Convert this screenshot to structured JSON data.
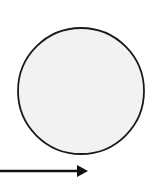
{
  "diagram": {
    "background": "#ffffff",
    "circle": {
      "cx": 81,
      "cy": 91,
      "r": 63,
      "fill": "#f2f2f2",
      "stroke": "#1a1a1a",
      "stroke_width": 1.8
    },
    "arrow": {
      "x1": 0,
      "y1": 171,
      "x2": 78,
      "y2": 171,
      "direction": "right",
      "color": "#111111",
      "stroke_width": 2.5,
      "head": {
        "tip_x": 88,
        "tip_y": 171,
        "half_height": 6,
        "length": 11
      }
    }
  }
}
